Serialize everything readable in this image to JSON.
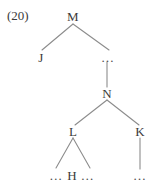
{
  "figure": {
    "example_number": "(20)",
    "type": "syntax-tree",
    "width": 155,
    "height": 182,
    "background_color": "#ffffff",
    "line_color": "#8c8c8c",
    "text_color": "#3b3b3b"
  },
  "nodes": [
    {
      "id": "M",
      "label": "M",
      "x": 73,
      "y": 16
    },
    {
      "id": "J",
      "label": "J",
      "x": 41,
      "y": 57
    },
    {
      "id": "dots_top",
      "label": "…",
      "x": 108,
      "y": 57
    },
    {
      "id": "N",
      "label": "N",
      "x": 107,
      "y": 93
    },
    {
      "id": "L",
      "label": "L",
      "x": 73,
      "y": 131
    },
    {
      "id": "K",
      "label": "K",
      "x": 140,
      "y": 131
    },
    {
      "id": "dots_under_k",
      "label": "…",
      "x": 140,
      "y": 175
    }
  ],
  "leaf_row": {
    "left_dots": "…",
    "head": "H",
    "right_dots": "…",
    "x": 72,
    "y": 175
  },
  "edges": [
    {
      "from": "M",
      "to": "J",
      "x1": 73,
      "y1": 24,
      "x2": 42,
      "y2": 50
    },
    {
      "from": "M",
      "to": "dots_top",
      "x1": 73,
      "y1": 24,
      "x2": 109,
      "y2": 50
    },
    {
      "from": "dots_top",
      "to": "N",
      "x1": 107,
      "y1": 62,
      "x2": 107,
      "y2": 87
    },
    {
      "from": "N",
      "to": "L",
      "x1": 107,
      "y1": 100,
      "x2": 75,
      "y2": 125
    },
    {
      "from": "N",
      "to": "K",
      "x1": 107,
      "y1": 100,
      "x2": 139,
      "y2": 125
    },
    {
      "from": "L",
      "to": "leaf_left",
      "x1": 73,
      "y1": 138,
      "x2": 56,
      "y2": 168
    },
    {
      "from": "L",
      "to": "leaf_right",
      "x1": 73,
      "y1": 138,
      "x2": 90,
      "y2": 168
    },
    {
      "from": "K",
      "to": "dots_under_k",
      "x1": 140,
      "y1": 138,
      "x2": 140,
      "y2": 169
    }
  ]
}
